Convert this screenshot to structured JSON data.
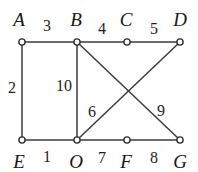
{
  "figure": {
    "background_color": "#ffffff",
    "edge_color": "#3c3c3c",
    "node_stroke_color": "#2e2e2e",
    "node_fill_color": "#ffffff",
    "label_color": "#171717",
    "width": 198,
    "height": 172
  },
  "nodes": [
    {
      "id": "A",
      "label": "A",
      "x": 22,
      "y": 42,
      "label_x": 19,
      "label_y": 19
    },
    {
      "id": "B",
      "label": "B",
      "x": 77,
      "y": 42,
      "label_x": 76,
      "label_y": 19
    },
    {
      "id": "C",
      "label": "C",
      "x": 127,
      "y": 42,
      "label_x": 126,
      "label_y": 19
    },
    {
      "id": "D",
      "label": "D",
      "x": 180,
      "y": 42,
      "label_x": 180,
      "label_y": 19
    },
    {
      "id": "E",
      "label": "E",
      "x": 22,
      "y": 140,
      "label_x": 19,
      "label_y": 161
    },
    {
      "id": "O",
      "label": "O",
      "x": 77,
      "y": 140,
      "label_x": 76,
      "label_y": 161
    },
    {
      "id": "F",
      "label": "F",
      "x": 127,
      "y": 140,
      "label_x": 126,
      "label_y": 161
    },
    {
      "id": "G",
      "label": "G",
      "x": 180,
      "y": 140,
      "label_x": 180,
      "label_y": 161
    }
  ],
  "edges": [
    {
      "id": "A-B",
      "from": "A",
      "to": "B",
      "weight": "3",
      "label_x": 47,
      "label_y": 26
    },
    {
      "id": "B-C",
      "from": "B",
      "to": "C",
      "weight": "4",
      "label_x": 102,
      "label_y": 29
    },
    {
      "id": "C-D",
      "from": "C",
      "to": "D",
      "weight": "5",
      "label_x": 154,
      "label_y": 29
    },
    {
      "id": "A-E",
      "from": "A",
      "to": "E",
      "weight": "2",
      "label_x": 12,
      "label_y": 88
    },
    {
      "id": "B-O",
      "from": "B",
      "to": "O",
      "weight": "10",
      "label_x": 64,
      "label_y": 86
    },
    {
      "id": "O-D",
      "from": "O",
      "to": "D",
      "weight": "6",
      "label_x": 92,
      "label_y": 112
    },
    {
      "id": "B-G",
      "from": "B",
      "to": "G",
      "weight": "9",
      "label_x": 161,
      "label_y": 111
    },
    {
      "id": "E-O",
      "from": "E",
      "to": "O",
      "weight": "1",
      "label_x": 47,
      "label_y": 157
    },
    {
      "id": "O-F",
      "from": "O",
      "to": "F",
      "weight": "7",
      "label_x": 102,
      "label_y": 158
    },
    {
      "id": "F-G",
      "from": "F",
      "to": "G",
      "weight": "8",
      "label_x": 154,
      "label_y": 158
    }
  ]
}
